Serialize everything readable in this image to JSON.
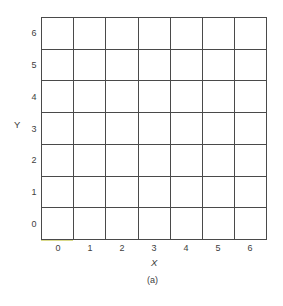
{
  "figure": {
    "caption": "(a)",
    "x_axis": {
      "title": "X",
      "ticks": [
        "0",
        "1",
        "2",
        "3",
        "4",
        "5",
        "6"
      ]
    },
    "y_axis": {
      "title": "Y",
      "ticks": [
        "6",
        "5",
        "4",
        "3",
        "2",
        "1",
        "0"
      ]
    },
    "grid": {
      "columns": 7,
      "rows": 7,
      "line_color": "#4a4a4a",
      "bottom_edge_tint": "#d9d98a"
    }
  }
}
